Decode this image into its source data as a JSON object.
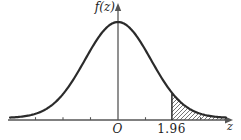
{
  "figure": {
    "labels": {
      "y_axis": "f(z)",
      "origin": "O",
      "critical_value": "1.96",
      "x_axis": "z"
    },
    "colors": {
      "curve": "#2b2b2b",
      "axis": "#565656",
      "hatch": "#3a3a3a",
      "text": "#1c1c1c",
      "background": "#ffffff"
    }
  },
  "chart_data": {
    "type": "area",
    "xlabel": "z",
    "ylabel": "f(z)",
    "grid": false,
    "curve": {
      "distribution": "standard-normal",
      "mean": 0,
      "sd": 1
    },
    "x_range": [
      -3.9,
      3.9
    ],
    "ylim": [
      0,
      0.45
    ],
    "x_ticks": [
      -3,
      -2,
      -1,
      1,
      3
    ],
    "origin_label": "O",
    "shaded_region": {
      "from": 1.96,
      "to": 3.9,
      "style": "diagonal-hatch"
    },
    "points": [
      {
        "z": -3,
        "f": 0.0044
      },
      {
        "z": -2,
        "f": 0.054
      },
      {
        "z": -1,
        "f": 0.242
      },
      {
        "z": 0,
        "f": 0.3989
      },
      {
        "z": 1,
        "f": 0.242
      },
      {
        "z": 1.96,
        "f": 0.0584
      },
      {
        "z": 2,
        "f": 0.054
      },
      {
        "z": 3,
        "f": 0.0044
      }
    ]
  }
}
